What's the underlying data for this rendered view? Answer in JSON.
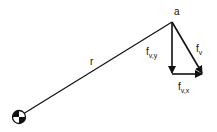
{
  "diagram": {
    "title": "",
    "point_label": "a",
    "radius_label": "r",
    "vectors": [
      {
        "id": "fv",
        "base": "f",
        "subscript": "v",
        "description": "resultant force vector"
      },
      {
        "id": "fvy",
        "base": "f",
        "subscript": "v,y",
        "description": "vertical component"
      },
      {
        "id": "fvx",
        "base": "f",
        "subscript": "v,x",
        "description": "horizontal component"
      }
    ],
    "pivot_symbol": "center-of-mass",
    "colors": {
      "ink": "#111111",
      "background": "#ffffff"
    }
  }
}
